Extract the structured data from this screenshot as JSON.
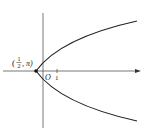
{
  "figure": {
    "type": "parabola-graph",
    "point_label_open": "(",
    "point_label_frac_num": "1",
    "point_label_frac_den": "2",
    "point_label_sep": ", π)",
    "origin_label": "O",
    "tick_label": "1",
    "colors": {
      "stroke": "#222222",
      "background": "#ffffff"
    }
  }
}
